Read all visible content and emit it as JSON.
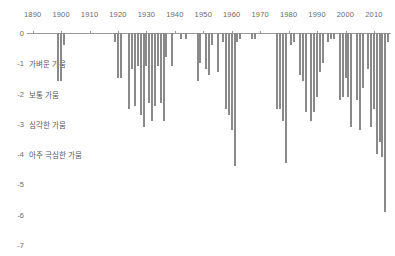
{
  "chart_data": {
    "type": "bar",
    "title": "",
    "subtitle": "",
    "xlabel": "",
    "ylabel": "",
    "xlim": [
      1888,
      2016
    ],
    "ylim": [
      -7,
      0
    ],
    "grid": false,
    "legend": null,
    "orientation": "vertical-downward",
    "bar_color": "#8a8a8a",
    "axis_color": "#9a9a9a",
    "text_color": "#6b6b6b",
    "x_ticks": [
      1890,
      1900,
      1910,
      1920,
      1930,
      1940,
      1950,
      1960,
      1970,
      1980,
      1990,
      2000,
      2010
    ],
    "x_tick_labels": [
      "1890",
      "1900",
      "1910",
      "1920",
      "1930",
      "1940",
      "1950",
      "1960",
      "1970",
      "1980",
      "1990",
      "2000",
      "2010"
    ],
    "y_ticks": [
      0,
      -1,
      -2,
      -3,
      -4,
      -5,
      -6,
      -7
    ],
    "y_tick_labels": [
      "0",
      "-1",
      "-2",
      "-3",
      "-4",
      "-5",
      "-6",
      "-7"
    ],
    "y_category_labels": [
      {
        "value": -1,
        "label": "가벼운 가뭄"
      },
      {
        "value": -2,
        "label": "보통 가뭄"
      },
      {
        "value": -3,
        "label": "심각한 가뭄"
      },
      {
        "value": -4,
        "label": "아주 극심한 가뭄"
      }
    ],
    "x": [
      1899,
      1900,
      1901,
      1919,
      1920,
      1921,
      1924,
      1925,
      1926,
      1927,
      1928,
      1929,
      1930,
      1931,
      1932,
      1933,
      1934,
      1935,
      1936,
      1937,
      1939,
      1942,
      1944,
      1948,
      1949,
      1951,
      1952,
      1953,
      1955,
      1957,
      1958,
      1959,
      1960,
      1961,
      1962,
      1963,
      1967,
      1968,
      1976,
      1977,
      1978,
      1979,
      1981,
      1982,
      1984,
      1985,
      1986,
      1988,
      1989,
      1990,
      1991,
      1992,
      1994,
      1995,
      1996,
      1998,
      1999,
      2000,
      2001,
      2002,
      2004,
      2005,
      2006,
      2008,
      2009,
      2010,
      2011,
      2012,
      2013,
      2014,
      2015
    ],
    "values": [
      -1.6,
      -1.6,
      -0.4,
      -0.3,
      -1.5,
      -1.5,
      -2.5,
      -1.2,
      -2.4,
      -1.1,
      -2.7,
      -3.1,
      -1.1,
      -2.3,
      -2.9,
      -2.4,
      -1.1,
      -2.3,
      -2.9,
      -0.8,
      -1.1,
      -0.2,
      -0.2,
      -1.6,
      -1.0,
      -1.2,
      -1.4,
      -0.4,
      -1.3,
      -0.3,
      -2.5,
      -2.7,
      -3.2,
      -4.4,
      -0.3,
      -0.2,
      -0.2,
      -0.2,
      -2.5,
      -2.5,
      -2.9,
      -4.3,
      -0.4,
      -0.3,
      -1.4,
      -1.6,
      -2.6,
      -2.9,
      -2.6,
      -2.1,
      -1.3,
      -1.0,
      -0.3,
      -0.2,
      -0.2,
      -2.2,
      -2.1,
      -1.5,
      -2.1,
      -3.1,
      -2.2,
      -3.2,
      -1.8,
      -1.2,
      -3.1,
      -2.5,
      -4.0,
      -3.6,
      -4.1,
      -5.9,
      -0.3
    ]
  },
  "axes": {
    "x_axis_name": "year-axis",
    "y_axis_name": "drought-index-axis"
  }
}
